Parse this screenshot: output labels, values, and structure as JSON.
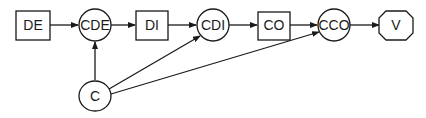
{
  "diagram": {
    "nodes": [
      {
        "id": "DE",
        "label": "DE",
        "shape": "rect",
        "cx": 33,
        "cy": 25
      },
      {
        "id": "CDE",
        "label": "CDE",
        "shape": "circle",
        "cx": 95,
        "cy": 25
      },
      {
        "id": "DI",
        "label": "DI",
        "shape": "rect",
        "cx": 152,
        "cy": 25
      },
      {
        "id": "CDI",
        "label": "CDI",
        "shape": "circle",
        "cx": 213,
        "cy": 25
      },
      {
        "id": "CO",
        "label": "CO",
        "shape": "rect",
        "cx": 274,
        "cy": 25
      },
      {
        "id": "CCO",
        "label": "CCO",
        "shape": "circle",
        "cx": 334,
        "cy": 25
      },
      {
        "id": "V",
        "label": "V",
        "shape": "octagon",
        "cx": 396,
        "cy": 25
      },
      {
        "id": "C",
        "label": "C",
        "shape": "circle",
        "cx": 95,
        "cy": 96
      }
    ],
    "edges": [
      {
        "from": "DE",
        "to": "CDE"
      },
      {
        "from": "CDE",
        "to": "DI"
      },
      {
        "from": "DI",
        "to": "CDI"
      },
      {
        "from": "CDI",
        "to": "CO"
      },
      {
        "from": "CO",
        "to": "CCO"
      },
      {
        "from": "CCO",
        "to": "V"
      },
      {
        "from": "C",
        "to": "CDE"
      },
      {
        "from": "C",
        "to": "CDI"
      },
      {
        "from": "C",
        "to": "CCO"
      }
    ],
    "colors": {
      "stroke": "#1a1a1a",
      "fill": "#ffffff"
    }
  }
}
